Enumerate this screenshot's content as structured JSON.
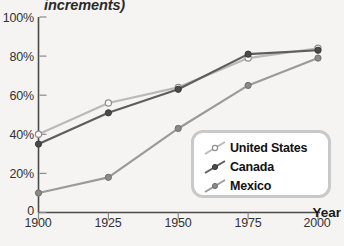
{
  "chart_data": {
    "type": "line",
    "title": "increments)",
    "xlabel": "Year",
    "ylabel": "",
    "x": [
      1900,
      1925,
      1950,
      1975,
      2000
    ],
    "xticklabels": [
      "1900",
      "1925",
      "1950",
      "1975",
      "2000"
    ],
    "yticklabels": [
      "0",
      "20%",
      "40%",
      "60%",
      "80%",
      "100%"
    ],
    "yticks": [
      0,
      20,
      40,
      60,
      80,
      100
    ],
    "xlim": [
      1900,
      2000
    ],
    "ylim": [
      0,
      100
    ],
    "grid": false,
    "legend_position": "lower right",
    "series": [
      {
        "name": "United States",
        "values": [
          40,
          56,
          64,
          79,
          84
        ],
        "color": "#b9b9b9",
        "marker": "open-circle"
      },
      {
        "name": "Canada",
        "values": [
          35,
          51,
          63,
          81,
          83
        ],
        "color": "#5d5d5d",
        "marker": "filled-circle"
      },
      {
        "name": "Mexico",
        "values": [
          10,
          18,
          43,
          65,
          79
        ],
        "color": "#9a9a9a",
        "marker": "filled-circle"
      }
    ]
  },
  "legend": {
    "items": [
      {
        "label": "United States"
      },
      {
        "label": "Canada"
      },
      {
        "label": "Mexico"
      }
    ]
  },
  "axes": {
    "x_axis_label": "Year",
    "y_tick_0": "0",
    "y_tick_20": "20%",
    "y_tick_40": "40%",
    "y_tick_60": "60%",
    "y_tick_80": "80%",
    "y_tick_100": "100%",
    "x_tick_1900": "1900",
    "x_tick_1925": "1925",
    "x_tick_1950": "1950",
    "x_tick_1975": "1975",
    "x_tick_2000": "2000"
  },
  "colors": {
    "background": "#f5f4f2",
    "axis": "#4a4a4a",
    "united_states": "#b9b9b9",
    "canada": "#5d5d5d",
    "mexico": "#9a9a9a",
    "legend_border": "#c9c9c9"
  }
}
